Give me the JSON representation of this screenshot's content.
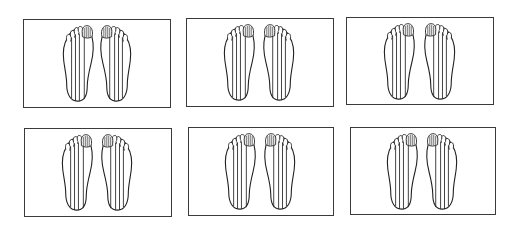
{
  "figure": {
    "layout": {
      "rows": 2,
      "columns": 3
    },
    "panels": [
      {
        "id": 1,
        "row": 1,
        "col": 1,
        "box": {
          "x": 23,
          "y": 19,
          "w": 148,
          "h": 89
        },
        "content": "pair-of-feet-plantar-view",
        "stripes_per_foot": 4,
        "hatched_toe": "big-toe"
      },
      {
        "id": 2,
        "row": 1,
        "col": 2,
        "box": {
          "x": 186,
          "y": 18,
          "w": 148,
          "h": 89
        },
        "content": "pair-of-feet-plantar-view",
        "stripes_per_foot": 4,
        "hatched_toe": "big-toe"
      },
      {
        "id": 3,
        "row": 1,
        "col": 3,
        "box": {
          "x": 346,
          "y": 17,
          "w": 148,
          "h": 88
        },
        "content": "pair-of-feet-plantar-view",
        "stripes_per_foot": 4,
        "hatched_toe": "big-toe"
      },
      {
        "id": 4,
        "row": 2,
        "col": 1,
        "box": {
          "x": 24,
          "y": 128,
          "w": 148,
          "h": 89
        },
        "content": "pair-of-feet-plantar-view",
        "stripes_per_foot": 4,
        "hatched_toe": "big-toe"
      },
      {
        "id": 5,
        "row": 2,
        "col": 2,
        "box": {
          "x": 188,
          "y": 127,
          "w": 146,
          "h": 89
        },
        "content": "pair-of-feet-plantar-view",
        "stripes_per_foot": 4,
        "hatched_toe": "big-toe"
      },
      {
        "id": 6,
        "row": 2,
        "col": 3,
        "box": {
          "x": 350,
          "y": 127,
          "w": 146,
          "h": 88
        },
        "content": "pair-of-feet-plantar-view",
        "stripes_per_foot": 4,
        "hatched_toe": "big-toe"
      }
    ],
    "colors": {
      "background": "#ffffff",
      "line": "#1e1e1e",
      "border": "#3a3a3a"
    }
  }
}
